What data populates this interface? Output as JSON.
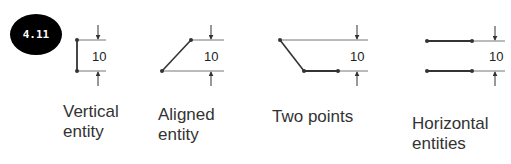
{
  "badge": {
    "label": "4.11"
  },
  "colors": {
    "line": "#333333",
    "extension": "#777777",
    "badge_bg": "#000000",
    "badge_text": "#ffffff"
  },
  "figures": [
    {
      "id": "vertical",
      "dimension": "10",
      "caption_line1": "Vertical",
      "caption_line2": "entity"
    },
    {
      "id": "aligned",
      "dimension": "10",
      "caption_line1": "Aligned",
      "caption_line2": "entity"
    },
    {
      "id": "two-points",
      "dimension": "10",
      "caption_line1": "Two points",
      "caption_line2": ""
    },
    {
      "id": "horizontal",
      "dimension": "10",
      "caption_line1": "Horizontal",
      "caption_line2": "entities"
    }
  ]
}
